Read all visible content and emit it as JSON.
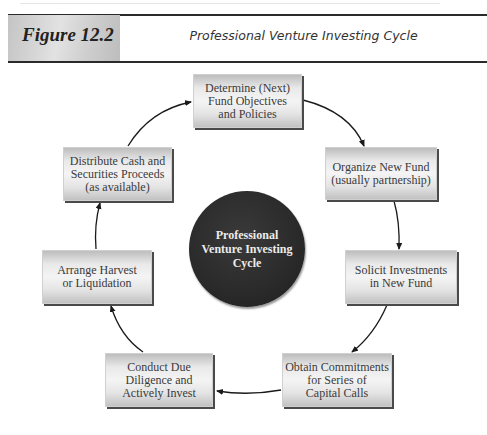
{
  "header": {
    "figure_label": "Figure 12.2",
    "figure_title": "Professional Venture Investing Cycle"
  },
  "center": {
    "lines": [
      "Professional",
      "Venture Investing",
      "Cycle"
    ]
  },
  "steps": [
    {
      "lines": [
        "Determine (Next)",
        "Fund Objectives",
        "and Policies"
      ]
    },
    {
      "lines": [
        "Organize New Fund",
        "(usually partnership)"
      ]
    },
    {
      "lines": [
        "Solicit Investments",
        "in New Fund"
      ]
    },
    {
      "lines": [
        "Obtain Commitments",
        "for Series of",
        "Capital Calls"
      ]
    },
    {
      "lines": [
        "Conduct Due",
        "Diligence and",
        "Actively Invest"
      ]
    },
    {
      "lines": [
        "Arrange Harvest",
        "or Liquidation"
      ]
    },
    {
      "lines": [
        "Distribute Cash and",
        "Securities Proceeds",
        "(as available)"
      ]
    }
  ],
  "flow": [
    "step-0 -> step-1",
    "step-1 -> step-2",
    "step-2 -> step-3",
    "step-3 -> step-4",
    "step-4 -> step-5",
    "step-5 -> step-6",
    "step-6 -> step-0"
  ]
}
